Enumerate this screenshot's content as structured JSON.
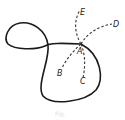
{
  "figure": {
    "labels": {
      "A": "A",
      "B": "B",
      "C": "C",
      "D": "D",
      "E": "E"
    },
    "caption": "Fig."
  }
}
